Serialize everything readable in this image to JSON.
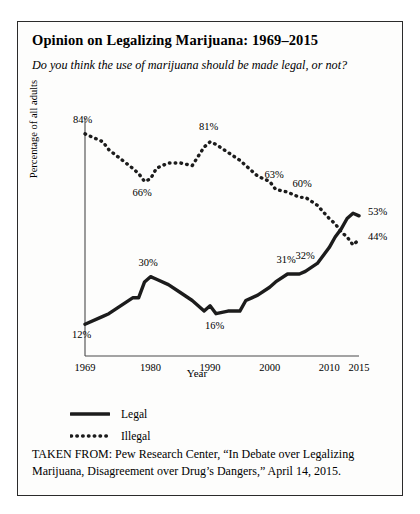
{
  "figure": {
    "title": "Opinion on Legalizing Marijuana: 1969–2015",
    "subtitle": "Do you think the use of marijuana should be made legal, or not?",
    "citation": "TAKEN FROM: Pew Research Center, “In Debate over Legalizing Marijuana, Disagreement over Drug’s Dangers,” April 14, 2015."
  },
  "legend": {
    "items": [
      {
        "label": "Legal",
        "style": "solid",
        "color": "#1c1c1c"
      },
      {
        "label": "Illegal",
        "style": "dotted",
        "color": "#1c1c1c"
      }
    ]
  },
  "chart_data": {
    "type": "line",
    "title": "Opinion on Legalizing Marijuana: 1969–2015",
    "subtitle": "Do you think the use of marijuana should be made legal, or not?",
    "xlabel": "Year",
    "ylabel": "Percentage of all adults",
    "xlim": [
      1969,
      2015
    ],
    "ylim": [
      0,
      90
    ],
    "grid": false,
    "legend_position": "below-plot-left",
    "xticks": [
      1969,
      1980,
      1990,
      2000,
      2010,
      2015
    ],
    "xtick_labels": [
      "1969",
      "1980",
      "1990",
      "2000",
      "2010",
      "2015"
    ],
    "yticks": [],
    "series": [
      {
        "name": "Legal",
        "style": "solid",
        "color": "#1c1c1c",
        "x": [
          1969,
          1972,
          1973,
          1977,
          1978,
          1979,
          1980,
          1981,
          1983,
          1985,
          1987,
          1989,
          1990,
          1991,
          1993,
          1995,
          1996,
          1997,
          1998,
          2000,
          2001,
          2003,
          2005,
          2006,
          2008,
          2010,
          2011,
          2012,
          2013,
          2014,
          2015
        ],
        "values": [
          12,
          15,
          16,
          22,
          22,
          28,
          30,
          29,
          27,
          24,
          21,
          17,
          19,
          16,
          17,
          17,
          21,
          22,
          23,
          26,
          28,
          31,
          31,
          32,
          35,
          41,
          45,
          48,
          52,
          54,
          53
        ]
      },
      {
        "name": "Illegal",
        "style": "dotted",
        "color": "#1c1c1c",
        "x": [
          1969,
          1972,
          1973,
          1977,
          1978,
          1979,
          1980,
          1981,
          1983,
          1985,
          1987,
          1989,
          1990,
          1991,
          1993,
          1995,
          1996,
          1997,
          1998,
          2000,
          2001,
          2003,
          2005,
          2006,
          2008,
          2010,
          2011,
          2012,
          2013,
          2014,
          2015
        ],
        "values": [
          84,
          81,
          78,
          71,
          69,
          66,
          67,
          71,
          73,
          73,
          72,
          79,
          81,
          80,
          77,
          74,
          72,
          70,
          68,
          66,
          63,
          62,
          60,
          60,
          57,
          52,
          50,
          47,
          45,
          42,
          44
        ]
      }
    ],
    "annotations": [
      {
        "series": "Illegal",
        "year": 1969,
        "value": 84,
        "text": "84%"
      },
      {
        "series": "Illegal",
        "year": 1979,
        "value": 66,
        "text": "66%"
      },
      {
        "series": "Illegal",
        "year": 1990,
        "value": 81,
        "text": "81%"
      },
      {
        "series": "Illegal",
        "year": 2001,
        "value": 63,
        "text": "63%"
      },
      {
        "series": "Illegal",
        "year": 2005,
        "value": 60,
        "text": "60%"
      },
      {
        "series": "Illegal",
        "year": 2015,
        "value": 44,
        "text": "44%"
      },
      {
        "series": "Legal",
        "year": 1969,
        "value": 12,
        "text": "12%"
      },
      {
        "series": "Legal",
        "year": 1980,
        "value": 30,
        "text": "30%"
      },
      {
        "series": "Legal",
        "year": 1991,
        "value": 16,
        "text": "16%"
      },
      {
        "series": "Legal",
        "year": 2003,
        "value": 31,
        "text": "31%"
      },
      {
        "series": "Legal",
        "year": 2006,
        "value": 32,
        "text": "32%"
      },
      {
        "series": "Legal",
        "year": 2015,
        "value": 53,
        "text": "53%"
      }
    ]
  }
}
